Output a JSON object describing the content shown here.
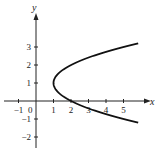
{
  "chart_data": {
    "type": "line",
    "title": "",
    "xlabel": "x",
    "ylabel": "y",
    "xlim": [
      -1.2,
      6.4
    ],
    "ylim": [
      -2.5,
      4.6
    ],
    "grid": false,
    "legend": null,
    "x_ticks": [
      -1,
      1,
      2,
      3,
      4,
      5
    ],
    "x_tick_labels": [
      "-1",
      "1",
      "2",
      "3",
      "4",
      "5"
    ],
    "y_ticks": [
      -2,
      -1,
      1,
      2,
      3
    ],
    "y_tick_labels": [
      "-2",
      "-1",
      "1",
      "2",
      "3"
    ],
    "origin_label": "0",
    "series": [
      {
        "name": "x = (y - 1)^2 + 1",
        "description": "Sideways parabola opening right, vertex at (1, 1), crossing x-axis at (2, 0)",
        "vertex": [
          1,
          1
        ],
        "y_range": [
          -1.2,
          3.2
        ],
        "points": [
          [
            5.84,
            -1.2
          ],
          [
            5.0,
            -1.0
          ],
          [
            3.25,
            -0.5
          ],
          [
            2.0,
            0.0
          ],
          [
            1.25,
            0.5
          ],
          [
            1.0,
            1.0
          ],
          [
            1.25,
            1.5
          ],
          [
            2.0,
            2.0
          ],
          [
            3.25,
            2.5
          ],
          [
            5.0,
            3.0
          ],
          [
            5.84,
            3.2
          ]
        ]
      }
    ]
  },
  "labels": {
    "x_axis": "x",
    "y_axis": "y",
    "origin": "0"
  },
  "colors": {
    "curve": "#111111",
    "axis": "#222222",
    "background": "#ffffff"
  }
}
